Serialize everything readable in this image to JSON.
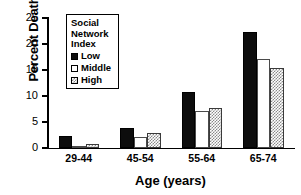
{
  "chart_data": {
    "type": "bar",
    "title": "",
    "xlabel": "Age (years)",
    "ylabel": "Percent Deaths",
    "categories": [
      "29-44",
      "45-54",
      "55-64",
      "65-74"
    ],
    "series": [
      {
        "name": "Low",
        "values": [
          2.4,
          3.8,
          10.8,
          22.3
        ],
        "color": "#0d0d0d",
        "fill": "solid-black"
      },
      {
        "name": "Middle",
        "values": [
          0.2,
          2.2,
          7.1,
          17.1
        ],
        "color": "#ffffff",
        "fill": "open-white"
      },
      {
        "name": "High",
        "values": [
          0.7,
          2.8,
          7.6,
          15.3
        ],
        "color": "#8a8a8a",
        "fill": "checkered-gray"
      }
    ],
    "ylim": [
      0,
      25
    ],
    "yticks": [
      0,
      5,
      10,
      15,
      20,
      25
    ],
    "ytick_labels": [
      "0",
      "5",
      "10",
      "15",
      "20",
      "25"
    ],
    "grid": false,
    "legend": {
      "position": "upper-left-inside",
      "title_lines": [
        "Social",
        "Network",
        "Index"
      ],
      "entries": [
        "Low",
        "Middle",
        "High"
      ]
    }
  }
}
